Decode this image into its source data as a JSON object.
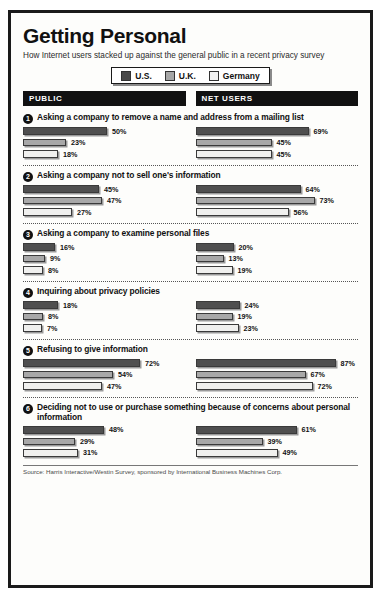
{
  "header": {
    "title": "Getting Personal",
    "subtitle": "How Internet users stacked up against the general public in a recent privacy survey"
  },
  "legend": {
    "items": [
      {
        "label": "U.S.",
        "color": "#4a4a4a"
      },
      {
        "label": "U.K.",
        "color": "#a6a6a6"
      },
      {
        "label": "Germany",
        "color": "#f2f2f2"
      }
    ]
  },
  "columns": [
    {
      "label": "PUBLIC"
    },
    {
      "label": "NET USERS"
    }
  ],
  "items": [
    {
      "number": "1",
      "title": "Asking a company to remove a name and address from a mailing list",
      "public": [
        "50%",
        "23%",
        "18%"
      ],
      "net": [
        "69%",
        "45%",
        "45%"
      ]
    },
    {
      "number": "2",
      "title": "Asking a company not to sell one's information",
      "public": [
        "45%",
        "47%",
        "27%"
      ],
      "net": [
        "64%",
        "73%",
        "56%"
      ]
    },
    {
      "number": "3",
      "title": "Asking a company to examine personal files",
      "public": [
        "16%",
        "9%",
        "8%"
      ],
      "net": [
        "20%",
        "13%",
        "19%"
      ]
    },
    {
      "number": "4",
      "title": "Inquiring about privacy policies",
      "public": [
        "18%",
        "8%",
        "7%"
      ],
      "net": [
        "24%",
        "19%",
        "23%"
      ]
    },
    {
      "number": "5",
      "title": "Refusing to give information",
      "public": [
        "72%",
        "54%",
        "47%"
      ],
      "net": [
        "87%",
        "67%",
        "72%"
      ]
    },
    {
      "number": "6",
      "title": "Deciding not to use or purchase something because of concerns about personal information",
      "public": [
        "48%",
        "29%",
        "31%"
      ],
      "net": [
        "61%",
        "39%",
        "49%"
      ]
    }
  ],
  "footer": {
    "source": "Source: Harris Interactive/Westin Survey, sponsored by International Business Machines Corp."
  },
  "chart_data": {
    "type": "bar",
    "title": "Getting Personal",
    "subtitle": "How Internet users stacked up against the general public in a recent privacy survey",
    "orientation": "horizontal",
    "grouping": "grouped",
    "series": [
      {
        "name": "U.S.",
        "color": "#4a4a4a"
      },
      {
        "name": "U.K.",
        "color": "#a6a6a6"
      },
      {
        "name": "Germany",
        "color": "#f2f2f2"
      }
    ],
    "panels": [
      "PUBLIC",
      "NET USERS"
    ],
    "categories": [
      "Asking a company to remove a name and address from a mailing list",
      "Asking a company not to sell one's information",
      "Asking a company to examine personal files",
      "Inquiring about privacy policies",
      "Refusing to give information",
      "Deciding not to use or purchase something because of concerns about personal information"
    ],
    "values": {
      "PUBLIC": {
        "U.S.": [
          50,
          45,
          16,
          18,
          72,
          48
        ],
        "U.K.": [
          23,
          47,
          9,
          8,
          54,
          29
        ],
        "Germany": [
          18,
          27,
          8,
          7,
          47,
          31
        ]
      },
      "NET USERS": {
        "U.S.": [
          69,
          64,
          20,
          24,
          87,
          61
        ],
        "U.K.": [
          45,
          73,
          13,
          19,
          67,
          39
        ],
        "Germany": [
          45,
          56,
          19,
          23,
          72,
          49
        ]
      }
    },
    "unit": "percent",
    "xlim": [
      0,
      100
    ],
    "xlabel": "",
    "ylabel": "",
    "grid": false,
    "legend_position": "top-center",
    "data_labels": true,
    "source": "Source: Harris Interactive/Westin Survey, sponsored by International Business Machines Corp."
  }
}
